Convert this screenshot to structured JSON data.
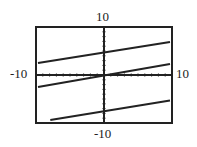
{
  "chart_data": {
    "type": "line",
    "title": "",
    "xlabel": "",
    "ylabel": "",
    "xlim": [
      -10,
      10
    ],
    "ylim": [
      -10,
      10
    ],
    "grid": false,
    "tick_labels": {
      "x_min": "-10",
      "x_max": "10",
      "y_min": "-10",
      "y_max": "10"
    },
    "series": [
      {
        "name": "upper line",
        "x": [
          -9.7,
          9.7
        ],
        "y": [
          2.5,
          6.9
        ]
      },
      {
        "name": "middle line",
        "x": [
          -9.7,
          9.7
        ],
        "y": [
          -2.5,
          2.3
        ]
      },
      {
        "name": "lower line",
        "x": [
          -7.9,
          9.7
        ],
        "y": [
          -9.4,
          -5.3
        ]
      }
    ]
  }
}
